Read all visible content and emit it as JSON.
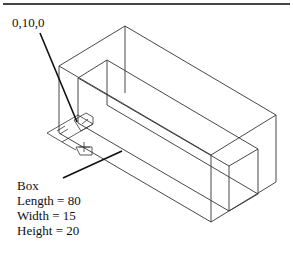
{
  "header": {
    "rule": true
  },
  "callout": {
    "coordinate_label": "0,10,0"
  },
  "box_info": {
    "title": "Box",
    "lines": [
      "Length = 80",
      "Width = 15",
      "Height = 20"
    ]
  },
  "diagram": {
    "type": "isometric wireframe box with inner box and UCS icon",
    "line_color": "#333333"
  }
}
